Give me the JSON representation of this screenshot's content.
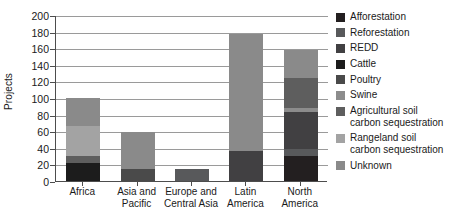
{
  "chart_data": {
    "type": "bar",
    "subtype": "stacked-bar",
    "title": "",
    "xlabel": "",
    "ylabel": "Projects",
    "ylim": [
      0,
      200
    ],
    "yticks": [
      0,
      20,
      40,
      60,
      80,
      100,
      120,
      140,
      160,
      180,
      200
    ],
    "grid": true,
    "legend_position": "right",
    "categories": [
      "Africa",
      "Asia and Pacific",
      "Europe and Central Asia",
      "Latin America",
      "North America"
    ],
    "series": [
      {
        "name": "Afforestation",
        "color": "#231f20",
        "values": [
          0,
          0,
          0,
          0,
          30
        ]
      },
      {
        "name": "Reforestation",
        "color": "#58595b",
        "values": [
          0,
          0,
          14,
          0,
          8
        ]
      },
      {
        "name": "REDD",
        "color": "#414042",
        "values": [
          0,
          0,
          0,
          36,
          45
        ]
      },
      {
        "name": "Cattle",
        "color": "#1c1c1c",
        "values": [
          22,
          0,
          0,
          0,
          0
        ]
      },
      {
        "name": "Poultry",
        "color": "#4a4a4a",
        "values": [
          0,
          14,
          0,
          0,
          0
        ]
      },
      {
        "name": "Swine",
        "color": "#8c8c8c",
        "values": [
          0,
          0,
          0,
          0,
          5
        ]
      },
      {
        "name": "Agricultural soil\ncarbon sequestration",
        "color": "#5e5e5e",
        "values": [
          8,
          0,
          0,
          0,
          36
        ]
      },
      {
        "name": "Rangeland soil\ncarbon sequestration",
        "color": "#a3a3a3",
        "values": [
          36,
          0,
          0,
          0,
          0
        ]
      },
      {
        "name": "Unknown",
        "color": "#8a8a8a",
        "values": [
          34,
          45,
          0,
          141,
          34
        ]
      }
    ],
    "totals": [
      100,
      59,
      14,
      177,
      158
    ]
  },
  "legend": {
    "entries": [
      {
        "label": "Afforestation",
        "color": "#231f20"
      },
      {
        "label": "Reforestation",
        "color": "#58595b"
      },
      {
        "label": "REDD",
        "color": "#414042"
      },
      {
        "label": "Cattle",
        "color": "#1c1c1c"
      },
      {
        "label": "Poultry",
        "color": "#4a4a4a"
      },
      {
        "label": "Swine",
        "color": "#8c8c8c"
      },
      {
        "label": "Agricultural soil\ncarbon sequestration",
        "color": "#5e5e5e"
      },
      {
        "label": "Rangeland soil\ncarbon sequestration",
        "color": "#a3a3a3"
      },
      {
        "label": "Unknown",
        "color": "#8a8a8a"
      }
    ]
  },
  "axes": {
    "y_title": "Projects",
    "y_tick_labels": [
      "0",
      "20",
      "40",
      "60",
      "80",
      "100",
      "120",
      "140",
      "160",
      "180",
      "200"
    ],
    "x_tick_labels": [
      "Africa",
      "Asia and\nPacific",
      "Europe and\nCentral Asia",
      "Latin\nAmerica",
      "North\nAmerica"
    ]
  },
  "style": {
    "background": "#ffffff",
    "axis_color": "#4d4d4d",
    "grid_color": "#9a9a9a",
    "text_color": "#1a1a1a"
  }
}
